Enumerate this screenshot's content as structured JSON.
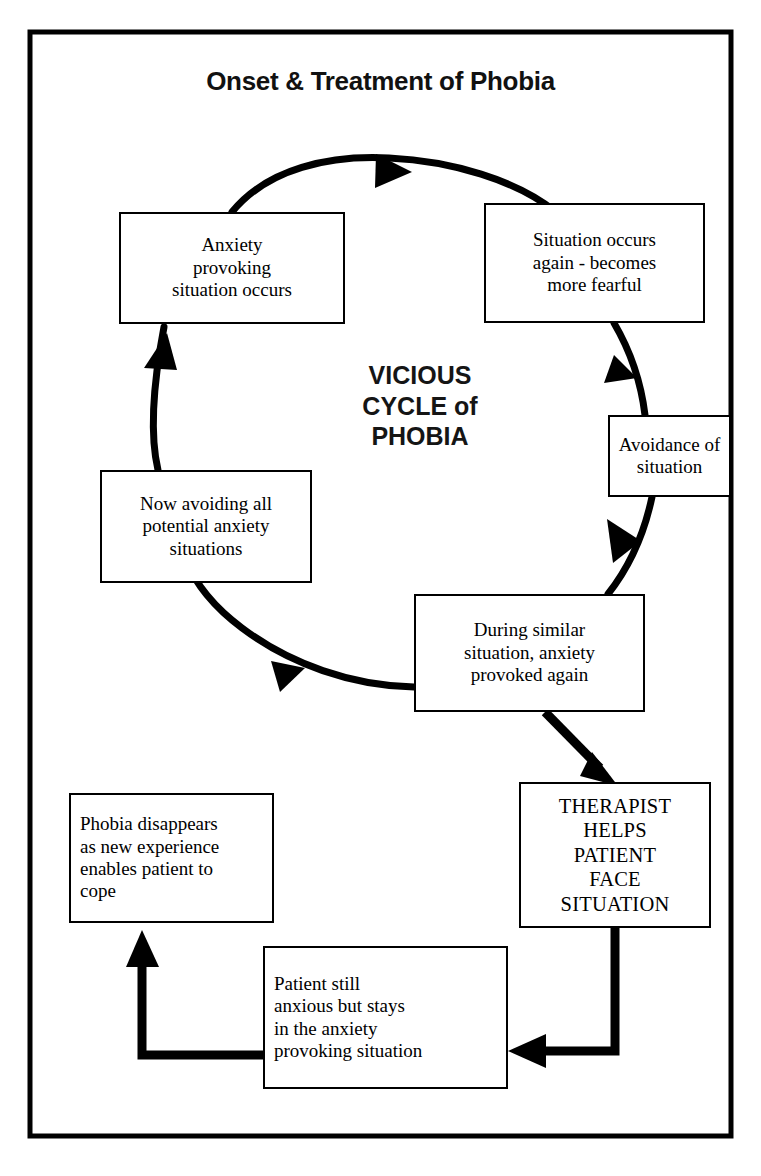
{
  "frame": {
    "border_color": "#000000"
  },
  "title": "Onset & Treatment of Phobia",
  "center_label": "VICIOUS\nCYCLE of\nPHOBIA",
  "colors": {
    "ink": "#000000",
    "paper": "#ffffff"
  },
  "nodes": {
    "anxiety_provoking": "Anxiety\nprovoking\nsituation occurs",
    "situation_again": "Situation occurs\nagain - becomes\nmore fearful",
    "avoidance": "Avoidance of\nsituation",
    "now_avoiding": "Now avoiding all\npotential anxiety\nsituations",
    "during_similar": "During similar\nsituation, anxiety\nprovoked again",
    "therapist": "THERAPIST\nHELPS\nPATIENT\nFACE\nSITUATION",
    "patient_still": "Patient still\nanxious but stays\nin the anxiety\nprovoking situation",
    "phobia_disappears": "Phobia disappears\nas new experience\nenables patient to\ncope"
  },
  "edges": [
    {
      "name": "anxiety-to-situation-again",
      "kind": "arc",
      "direction": "clockwise"
    },
    {
      "name": "situation-again-to-avoidance",
      "kind": "arc",
      "direction": "clockwise"
    },
    {
      "name": "avoidance-to-during-similar",
      "kind": "arc",
      "direction": "clockwise"
    },
    {
      "name": "during-similar-to-now-avoiding",
      "kind": "arc",
      "direction": "clockwise"
    },
    {
      "name": "now-avoiding-to-anxiety",
      "kind": "arc",
      "direction": "clockwise"
    },
    {
      "name": "during-similar-to-therapist",
      "kind": "straight",
      "direction": "diagonal-down-right"
    },
    {
      "name": "therapist-to-patient-still",
      "kind": "elbow",
      "direction": "down-then-left"
    },
    {
      "name": "patient-still-to-phobia-disappears",
      "kind": "elbow",
      "direction": "left-then-up"
    }
  ]
}
